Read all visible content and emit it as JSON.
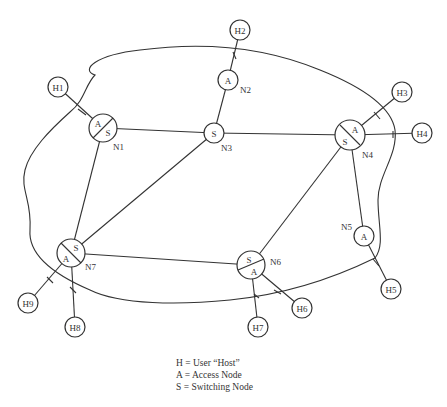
{
  "diagram": {
    "nodes": [
      {
        "id": "N1",
        "types": [
          "A",
          "S"
        ]
      },
      {
        "id": "N2",
        "types": [
          "A"
        ]
      },
      {
        "id": "N3",
        "types": [
          "S"
        ]
      },
      {
        "id": "N4",
        "types": [
          "A",
          "S"
        ]
      },
      {
        "id": "N5",
        "types": [
          "A"
        ]
      },
      {
        "id": "N6",
        "types": [
          "S",
          "A"
        ]
      },
      {
        "id": "N7",
        "types": [
          "S",
          "A"
        ]
      }
    ],
    "hosts": [
      "H1",
      "H2",
      "H3",
      "H4",
      "H5",
      "H6",
      "H7",
      "H8",
      "H9"
    ],
    "host_links": [
      [
        "H1",
        "N1"
      ],
      [
        "H2",
        "N2"
      ],
      [
        "H3",
        "N4"
      ],
      [
        "H4",
        "N4"
      ],
      [
        "H5",
        "N5"
      ],
      [
        "H6",
        "N6"
      ],
      [
        "H7",
        "N6"
      ],
      [
        "H8",
        "N7"
      ],
      [
        "H9",
        "N7"
      ]
    ],
    "node_links": [
      [
        "N1",
        "N3"
      ],
      [
        "N1",
        "N7"
      ],
      [
        "N2",
        "N3"
      ],
      [
        "N3",
        "N4"
      ],
      [
        "N3",
        "N7"
      ],
      [
        "N4",
        "N5"
      ],
      [
        "N4",
        "N6"
      ],
      [
        "N6",
        "N7"
      ]
    ],
    "labels": {
      "N1": "N1",
      "N2": "N2",
      "N3": "N3",
      "N4": "N4",
      "N5": "N5",
      "N6": "N6",
      "N7": "N7",
      "H1": "H1",
      "H2": "H2",
      "H3": "H3",
      "H4": "H4",
      "H5": "H5",
      "H6": "H6",
      "H7": "H7",
      "H8": "H8",
      "H9": "H9",
      "A": "A",
      "S": "S"
    }
  },
  "legend": {
    "line1": "H = User “Host”",
    "line2": "A = Access Node",
    "line3": "S = Switching Node"
  }
}
